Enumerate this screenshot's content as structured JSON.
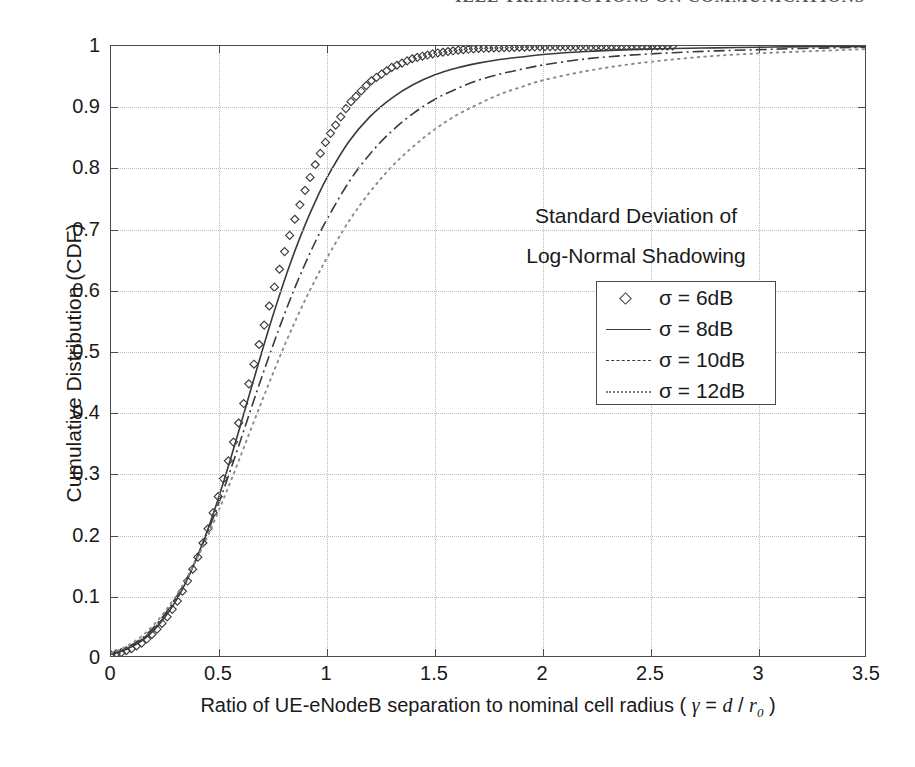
{
  "page_header": {
    "text": "IEEE TRANSACTIONS ON COMMUNICATIONS"
  },
  "figure": {
    "annotation_line1": "Standard Deviation of",
    "annotation_line2": "Log-Normal Shadowing",
    "xlabel_prefix": "Ratio of UE-eNodeB separation to nominal cell radius ( ",
    "xlabel_gamma": "γ",
    "xlabel_eq": " = ",
    "xlabel_d": "d",
    "xlabel_slash": " / ",
    "xlabel_r": "r",
    "xlabel_sub": "0",
    "xlabel_suffix": " )",
    "ylabel": "Cumulative Distribution (CDF)",
    "legend": {
      "items": [
        {
          "label": "σ = 6dB",
          "style": "diamond-marker"
        },
        {
          "label": "σ = 8dB",
          "style": "solid-line"
        },
        {
          "label": "σ = 10dB",
          "style": "dash-dot-line"
        },
        {
          "label": "σ = 12dB",
          "style": "dotted-line"
        }
      ]
    }
  },
  "chart_data": {
    "type": "line",
    "title": "",
    "xlabel": "Ratio of UE-eNodeB separation to nominal cell radius ( γ = d / r0 )",
    "ylabel": "Cumulative Distribution (CDF)",
    "xlim": [
      0,
      3.5
    ],
    "ylim": [
      0,
      1
    ],
    "xticks": [
      0,
      0.5,
      1,
      1.5,
      2,
      2.5,
      3,
      3.5
    ],
    "xtick_labels": [
      "0",
      "0.5",
      "1",
      "1.5",
      "2",
      "2.5",
      "3",
      "3.5"
    ],
    "yticks": [
      0,
      0.1,
      0.2,
      0.3,
      0.4,
      0.5,
      0.6,
      0.7,
      0.8,
      0.9,
      1
    ],
    "ytick_labels": [
      "0",
      "0.1",
      "0.2",
      "0.3",
      "0.4",
      "0.5",
      "0.6",
      "0.7",
      "0.8",
      "0.9",
      "1"
    ],
    "grid": true,
    "grid_style": "dotted",
    "legend_position": "center-right",
    "legend_title": "Standard Deviation of Log-Normal Shadowing",
    "x": [
      0,
      0.05,
      0.1,
      0.15,
      0.2,
      0.25,
      0.3,
      0.35,
      0.4,
      0.45,
      0.5,
      0.55,
      0.6,
      0.65,
      0.7,
      0.75,
      0.8,
      0.85,
      0.9,
      0.95,
      1.0,
      1.1,
      1.2,
      1.3,
      1.4,
      1.5,
      1.6,
      1.7,
      1.8,
      1.9,
      2.0,
      2.2,
      2.4,
      2.6,
      2.8,
      3.0,
      3.2,
      3.5
    ],
    "series": [
      {
        "name": "σ = 6dB",
        "style": "diamond-marker",
        "marker": "diamond",
        "marker_end_x": 2.6,
        "values": [
          0.005,
          0.009,
          0.016,
          0.026,
          0.042,
          0.062,
          0.088,
          0.122,
          0.163,
          0.212,
          0.268,
          0.33,
          0.396,
          0.464,
          0.532,
          0.598,
          0.66,
          0.716,
          0.766,
          0.81,
          0.848,
          0.905,
          0.942,
          0.965,
          0.98,
          0.988,
          0.993,
          0.996,
          0.997,
          0.998,
          0.999,
          0.999,
          1.0,
          1.0,
          1.0,
          1.0,
          1.0,
          1.0
        ]
      },
      {
        "name": "σ = 8dB",
        "style": "solid-line",
        "values": [
          0.006,
          0.011,
          0.019,
          0.03,
          0.046,
          0.067,
          0.093,
          0.126,
          0.166,
          0.212,
          0.264,
          0.321,
          0.381,
          0.442,
          0.502,
          0.56,
          0.614,
          0.664,
          0.709,
          0.749,
          0.785,
          0.843,
          0.885,
          0.915,
          0.937,
          0.953,
          0.964,
          0.972,
          0.978,
          0.982,
          0.986,
          0.991,
          0.994,
          0.996,
          0.997,
          0.998,
          0.999,
          0.999
        ]
      },
      {
        "name": "σ = 10dB",
        "style": "dash-dot-line",
        "values": [
          0.007,
          0.013,
          0.022,
          0.034,
          0.051,
          0.072,
          0.098,
          0.129,
          0.166,
          0.208,
          0.254,
          0.304,
          0.356,
          0.409,
          0.461,
          0.511,
          0.559,
          0.604,
          0.645,
          0.683,
          0.717,
          0.777,
          0.824,
          0.861,
          0.89,
          0.913,
          0.93,
          0.944,
          0.954,
          0.962,
          0.969,
          0.979,
          0.985,
          0.989,
          0.992,
          0.994,
          0.996,
          0.998
        ]
      },
      {
        "name": "σ = 12dB",
        "style": "dotted-line",
        "values": [
          0.008,
          0.015,
          0.025,
          0.038,
          0.055,
          0.076,
          0.101,
          0.13,
          0.164,
          0.201,
          0.242,
          0.285,
          0.33,
          0.376,
          0.421,
          0.465,
          0.508,
          0.548,
          0.586,
          0.621,
          0.654,
          0.713,
          0.762,
          0.803,
          0.836,
          0.864,
          0.887,
          0.905,
          0.921,
          0.933,
          0.944,
          0.959,
          0.97,
          0.978,
          0.984,
          0.988,
          0.991,
          0.995
        ]
      }
    ]
  }
}
